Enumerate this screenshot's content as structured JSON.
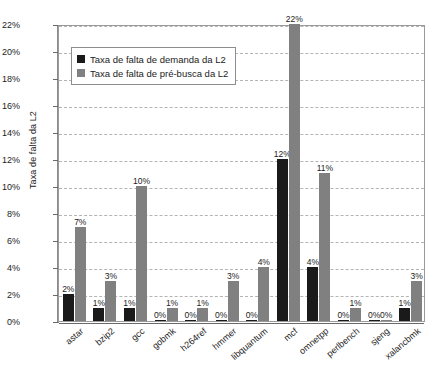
{
  "chart_data": {
    "type": "bar",
    "title": "",
    "xlabel": "",
    "ylabel": "Taxa de falta da L2",
    "ylim": [
      0,
      22
    ],
    "ytick_step": 2,
    "ytick_labels": [
      "0%",
      "2%",
      "4%",
      "6%",
      "8%",
      "10%",
      "12%",
      "14%",
      "16%",
      "18%",
      "20%",
      "22%"
    ],
    "grid": true,
    "legend_position": "top-left-inside",
    "categories": [
      "astar",
      "bzip2",
      "gcc",
      "gobmk",
      "h264ref",
      "hmmer",
      "libquantum",
      "mcf",
      "omnetpp",
      "perlbench",
      "sjeng",
      "xalancbmk"
    ],
    "series": [
      {
        "name": "Taxa de falta de demanda da L2",
        "color": "#1a1a1a",
        "values": [
          2,
          1,
          1,
          0,
          0,
          0,
          0,
          12,
          4,
          0,
          0,
          1
        ],
        "labels": [
          "2%",
          "1%",
          "1%",
          "0%",
          "0%",
          "0%",
          "0%",
          "12%",
          "4%",
          "0%",
          "0%",
          "1%"
        ]
      },
      {
        "name": "Taxa de falta de pré-busca da L2",
        "color": "#808080",
        "values": [
          7,
          3,
          10,
          1,
          1,
          3,
          4,
          22,
          11,
          1,
          0,
          3
        ],
        "labels": [
          "7%",
          "3%",
          "10%",
          "1%",
          "1%",
          "3%",
          "4%",
          "22%",
          "11%",
          "1%",
          "0%",
          "3%"
        ]
      }
    ]
  },
  "legend": {
    "items": [
      {
        "label": "Taxa de falta de demanda da L2",
        "swatch": "demand"
      },
      {
        "label": "Taxa de falta de pré-busca da L2",
        "swatch": "prefetch"
      }
    ]
  }
}
